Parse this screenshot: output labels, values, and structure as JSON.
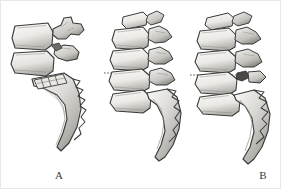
{
  "figure": {
    "background_color": "#ffffff",
    "border_color": "#e8e8e8",
    "ink_color": "#3a3a3a",
    "bone_fill_light": "#f2f2f0",
    "bone_fill_mid": "#cfcfcb",
    "bone_fill_dark": "#9a9a96",
    "shadow_color": "#7c7c78"
  },
  "panels": [
    {
      "id": "a",
      "label": "A",
      "label_x": 58,
      "label_y": 176,
      "description": "Lateral view of lower lumbar vertebrae with sacrum showing fused sacral segments and hatched endplate markings",
      "vertebra_count": 2,
      "has_dotted_line": false,
      "has_sacral_segment_lines": true,
      "sacrum_present": true
    },
    {
      "id": "b",
      "label": "B",
      "label_x": 172,
      "label_y": 176,
      "description": "Lateral view of four lumbar vertebrae with sacrum and a horizontal dotted reference line at the disc space",
      "vertebra_count": 4,
      "has_dotted_line": true,
      "dotted_line_y": 72,
      "has_sacral_segment_lines": false,
      "sacrum_present": true
    },
    {
      "id": "c",
      "label": "C",
      "label_x": 257,
      "label_y": 176,
      "description": "Lateral view of four lumbar vertebrae with sacrum and a horizontal dotted reference line, with darker facet shading",
      "vertebra_count": 4,
      "has_dotted_line": true,
      "dotted_line_y": 74,
      "has_sacral_segment_lines": false,
      "sacrum_present": true
    }
  ]
}
